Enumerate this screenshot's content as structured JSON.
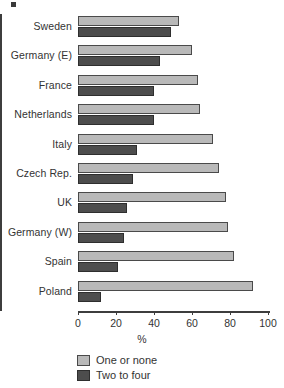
{
  "chart_data": {
    "type": "bar",
    "orientation": "horizontal",
    "title": "",
    "xlabel": "%",
    "ylabel": "",
    "xlim": [
      0,
      100
    ],
    "xticks": [
      0,
      20,
      40,
      60,
      80,
      100
    ],
    "grid": false,
    "legend_position": "bottom-left",
    "categories": [
      "Sweden",
      "Germany (E)",
      "France",
      "Netherlands",
      "Italy",
      "Czech Rep.",
      "UK",
      "Germany (W)",
      "Spain",
      "Poland"
    ],
    "series": [
      {
        "name": "One or none",
        "color": "#b9b9b9",
        "values": [
          53,
          60,
          63,
          64,
          71,
          74,
          78,
          79,
          82,
          92
        ]
      },
      {
        "name": "Two to four",
        "color": "#4d4d4d",
        "values": [
          49,
          43,
          40,
          40,
          31,
          29,
          26,
          24,
          21,
          12
        ]
      }
    ]
  },
  "legend": {
    "items": [
      {
        "label": "One or none",
        "swatch": "light"
      },
      {
        "label": "Two to four",
        "swatch": "dark"
      }
    ]
  }
}
